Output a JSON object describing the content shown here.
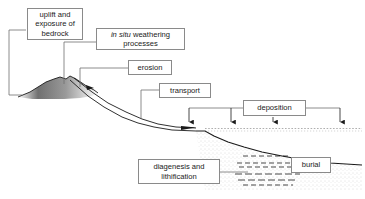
{
  "diagram": {
    "background_color": "#ffffff",
    "line_color": "#1a1a1a",
    "box_border_color": "#8a8a8a",
    "labels": {
      "uplift": "uplift and\nexposure of\nbedrock",
      "weathering_italic": "in situ",
      "weathering_rest": " weathering\nprocesses",
      "erosion": "erosion",
      "transport": "transport",
      "deposition": "deposition",
      "diagenesis": "diagenesis and\nlithification",
      "burial": "burial"
    },
    "features": {
      "bedrock": "mountain-bedrock-massif",
      "river": "river-channel",
      "water_surface": "sea-water-surface",
      "seafloor": "seafloor-profile",
      "sediment_wedge": "stippled-sediment-wedge",
      "strata": "dashed-sediment-strata"
    }
  }
}
